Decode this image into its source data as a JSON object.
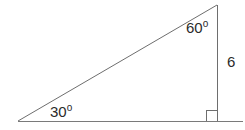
{
  "figure": {
    "type": "right-triangle",
    "background_color": "#ffffff",
    "stroke_color": "#6e6e6e",
    "text_color": "#2b2b2b",
    "stroke_width": 1,
    "vertices": {
      "bottom_left": {
        "x": 18,
        "y": 121
      },
      "top_right": {
        "x": 217,
        "y": 5
      },
      "bottom_right": {
        "x": 217,
        "y": 121
      }
    },
    "base_line": {
      "x1": 18,
      "y1": 121,
      "x2": 243,
      "y2": 121
    },
    "vertical_line": {
      "x1": 217,
      "y1": 5,
      "x2": 217,
      "y2": 121
    },
    "hypotenuse_line": {
      "x1": 18,
      "y1": 121,
      "x2": 217,
      "y2": 5
    },
    "right_angle_marker": {
      "x": 206,
      "y": 110,
      "size": 11
    }
  },
  "labels": {
    "angle_bottom_left": {
      "value": "30",
      "degree_symbol": "o",
      "full": "30o"
    },
    "angle_top_right": {
      "value": "60",
      "degree_symbol": "o",
      "full": "60o"
    },
    "side_right": {
      "value": "6"
    }
  }
}
